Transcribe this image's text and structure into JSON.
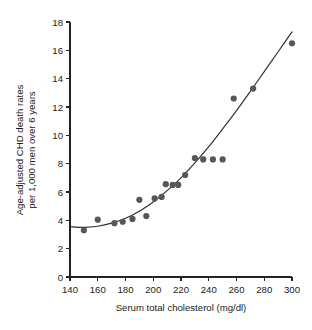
{
  "chart_data": {
    "type": "scatter",
    "title": "",
    "xlabel": "Serum total cholesterol (mg/dl)",
    "ylabel_line1": "Age-adjusted CHD death rates",
    "ylabel_line2": "per 1,000 men over 6 years",
    "xlim": [
      140,
      300
    ],
    "ylim": [
      0,
      18
    ],
    "xticks": [
      140,
      160,
      180,
      200,
      220,
      240,
      260,
      280,
      300
    ],
    "yticks": [
      0,
      2,
      4,
      6,
      8,
      10,
      12,
      14,
      16,
      18
    ],
    "grid": false,
    "legend": null,
    "marker_color": "#575757",
    "curve_color": "#2e2e2e",
    "axis_color": "#232323",
    "background_color": "#ffffff",
    "points": [
      {
        "x": 150,
        "y": 3.3
      },
      {
        "x": 160,
        "y": 4.05
      },
      {
        "x": 172,
        "y": 3.8
      },
      {
        "x": 178,
        "y": 3.9
      },
      {
        "x": 185,
        "y": 4.1
      },
      {
        "x": 190,
        "y": 5.45
      },
      {
        "x": 195,
        "y": 4.3
      },
      {
        "x": 201,
        "y": 5.55
      },
      {
        "x": 206,
        "y": 5.65
      },
      {
        "x": 209,
        "y": 6.55
      },
      {
        "x": 214,
        "y": 6.5
      },
      {
        "x": 218,
        "y": 6.5
      },
      {
        "x": 223,
        "y": 7.2
      },
      {
        "x": 230,
        "y": 8.4
      },
      {
        "x": 236,
        "y": 8.3
      },
      {
        "x": 243,
        "y": 8.3
      },
      {
        "x": 250,
        "y": 8.3
      },
      {
        "x": 258,
        "y": 12.6
      },
      {
        "x": 272,
        "y": 13.3
      },
      {
        "x": 300,
        "y": 16.5
      }
    ],
    "fit_curve": [
      {
        "x": 140,
        "y": 3.55
      },
      {
        "x": 150,
        "y": 3.5
      },
      {
        "x": 160,
        "y": 3.58
      },
      {
        "x": 170,
        "y": 3.8
      },
      {
        "x": 180,
        "y": 4.15
      },
      {
        "x": 190,
        "y": 4.65
      },
      {
        "x": 200,
        "y": 5.3
      },
      {
        "x": 210,
        "y": 6.1
      },
      {
        "x": 220,
        "y": 7.0
      },
      {
        "x": 230,
        "y": 8.05
      },
      {
        "x": 240,
        "y": 9.2
      },
      {
        "x": 250,
        "y": 10.45
      },
      {
        "x": 260,
        "y": 11.75
      },
      {
        "x": 270,
        "y": 13.1
      },
      {
        "x": 280,
        "y": 14.5
      },
      {
        "x": 290,
        "y": 15.9
      },
      {
        "x": 300,
        "y": 17.3
      }
    ]
  }
}
